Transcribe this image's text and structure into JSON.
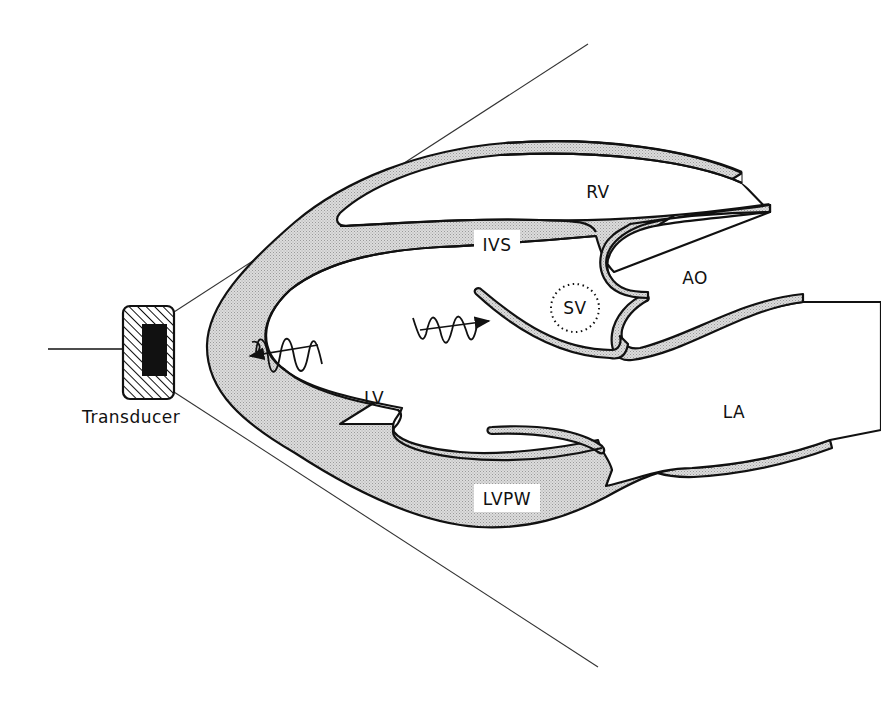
{
  "figure": {
    "colors": {
      "wall_fill": "#cfcfcf",
      "outline": "#111111",
      "background": "#ffffff"
    }
  },
  "labels": {
    "transducer": "Transducer",
    "rv": "RV",
    "ivs": "IVS",
    "ao": "AO",
    "sv": "SV",
    "lv": "LV",
    "la": "LA",
    "lvpw": "LVPW"
  },
  "elements": {
    "transducer": {
      "icon": "transducer-icon",
      "has_cable": true
    },
    "scan_sector": {
      "icon": "sector-lines"
    },
    "sample_volume": {
      "icon": "dotted-circle",
      "label": "SV"
    },
    "emitted_wave": {
      "icon": "wave-arrow-right"
    },
    "reflected_wave": {
      "icon": "wave-arrow-left"
    }
  }
}
